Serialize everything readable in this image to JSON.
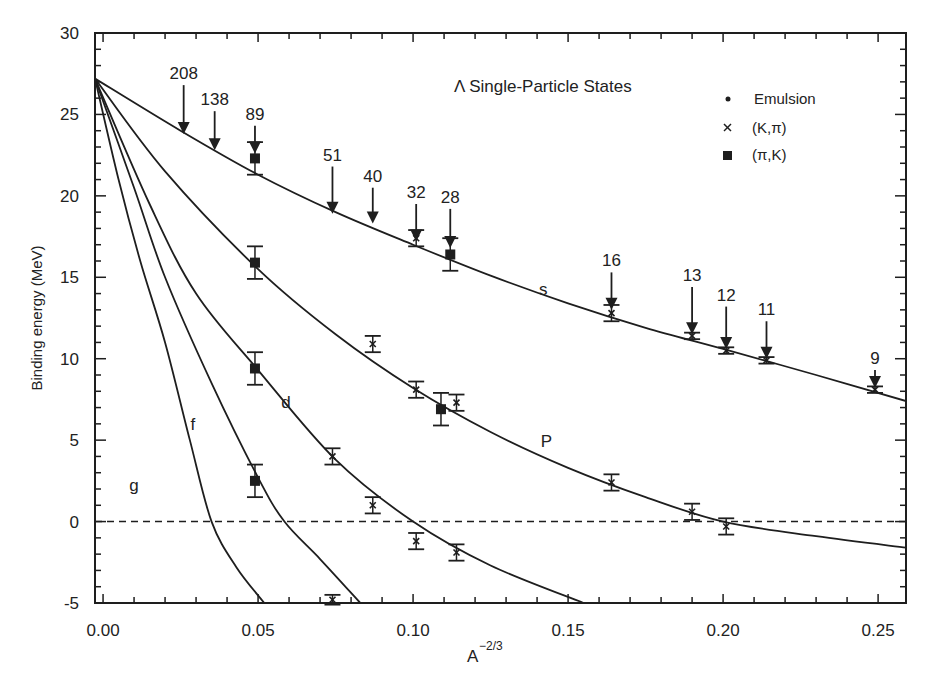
{
  "chart_data": {
    "type": "scatter",
    "title": "",
    "annotation_title": "Λ Single-Particle States",
    "xlabel": "A",
    "xlabel_superscript": "−2/3",
    "ylabel": "Binding energy (MeV)",
    "xlim": [
      -0.0026,
      0.259
    ],
    "ylim": [
      -5,
      30
    ],
    "x_ticks": [
      0.0,
      0.05,
      0.1,
      0.15,
      0.2,
      0.25
    ],
    "x_tick_labels": [
      "0.00",
      "0.05",
      "0.10",
      "0.15",
      "0.20",
      "0.25"
    ],
    "x_minor_step": 0.01,
    "y_ticks": [
      -5,
      0,
      5,
      10,
      15,
      20,
      25,
      30
    ],
    "y_tick_labels": [
      "-5",
      "0",
      "5",
      "10",
      "15",
      "20",
      "25",
      "30"
    ],
    "y_minor_step": 1,
    "grid": false,
    "zero_line": {
      "y": 0,
      "style": "dashed"
    },
    "legend": {
      "position": "upper right",
      "entries": [
        {
          "label": "Emulsion",
          "marker": "dot"
        },
        {
          "label": "(K,π)",
          "marker": "cross"
        },
        {
          "label": "(π,K)",
          "marker": "square"
        }
      ]
    },
    "curves": [
      {
        "name": "s",
        "label_pos": [
          0.142,
          13.9
        ],
        "points": [
          [
            -0.0026,
            27.2
          ],
          [
            0.025,
            24.0
          ],
          [
            0.05,
            21.3
          ],
          [
            0.075,
            19.0
          ],
          [
            0.1,
            17.0
          ],
          [
            0.125,
            15.1
          ],
          [
            0.15,
            13.4
          ],
          [
            0.175,
            11.9
          ],
          [
            0.2,
            10.6
          ],
          [
            0.23,
            9.0
          ],
          [
            0.259,
            7.4
          ]
        ]
      },
      {
        "name": "P",
        "label_pos": [
          0.143,
          4.6
        ],
        "points": [
          [
            -0.0026,
            27.2
          ],
          [
            0.02,
            21.5
          ],
          [
            0.05,
            15.5
          ],
          [
            0.075,
            11.5
          ],
          [
            0.1,
            8.2
          ],
          [
            0.125,
            5.5
          ],
          [
            0.15,
            3.3
          ],
          [
            0.175,
            1.5
          ],
          [
            0.2,
            0.0
          ],
          [
            0.23,
            -0.9
          ],
          [
            0.259,
            -1.6
          ]
        ]
      },
      {
        "name": "d",
        "label_pos": [
          0.059,
          7.0
        ],
        "points": [
          [
            -0.0026,
            27.2
          ],
          [
            0.015,
            19.5
          ],
          [
            0.03,
            14.0
          ],
          [
            0.05,
            9.3
          ],
          [
            0.075,
            3.8
          ],
          [
            0.1,
            0.0
          ],
          [
            0.125,
            -2.7
          ],
          [
            0.155,
            -5.0
          ]
        ]
      },
      {
        "name": "f",
        "label_pos": [
          0.029,
          5.6
        ],
        "points": [
          [
            -0.0026,
            27.2
          ],
          [
            0.01,
            20.5
          ],
          [
            0.02,
            15.0
          ],
          [
            0.035,
            8.5
          ],
          [
            0.05,
            2.7
          ],
          [
            0.0585,
            0.0
          ],
          [
            0.07,
            -2.3
          ],
          [
            0.083,
            -5.0
          ]
        ]
      },
      {
        "name": "g",
        "label_pos": [
          0.01,
          1.9
        ],
        "points": [
          [
            -0.0026,
            27.2
          ],
          [
            0.005,
            21.0
          ],
          [
            0.012,
            16.0
          ],
          [
            0.02,
            11.0
          ],
          [
            0.028,
            5.0
          ],
          [
            0.035,
            0.0
          ],
          [
            0.043,
            -2.8
          ],
          [
            0.052,
            -5.0
          ]
        ]
      }
    ],
    "series": [
      {
        "name": "(π,K)",
        "marker": "square",
        "points": [
          {
            "x": 0.049,
            "y": 22.3,
            "err": 1.0
          },
          {
            "x": 0.112,
            "y": 16.4,
            "err": 1.0
          },
          {
            "x": 0.049,
            "y": 15.9,
            "err": 1.0
          },
          {
            "x": 0.049,
            "y": 9.4,
            "err": 1.0
          },
          {
            "x": 0.109,
            "y": 6.9,
            "err": 1.0
          },
          {
            "x": 0.049,
            "y": 2.5,
            "err": 1.0
          }
        ]
      },
      {
        "name": "(K,π)",
        "marker": "cross",
        "points": [
          {
            "x": 0.101,
            "y": 17.4,
            "err": 0.5
          },
          {
            "x": 0.164,
            "y": 12.8,
            "err": 0.5
          },
          {
            "x": 0.19,
            "y": 11.4,
            "err": 0.2
          },
          {
            "x": 0.201,
            "y": 10.5,
            "err": 0.2
          },
          {
            "x": 0.214,
            "y": 9.9,
            "err": 0.2
          },
          {
            "x": 0.249,
            "y": 8.1,
            "err": 0.2
          },
          {
            "x": 0.087,
            "y": 10.9,
            "err": 0.5
          },
          {
            "x": 0.101,
            "y": 8.1,
            "err": 0.5
          },
          {
            "x": 0.114,
            "y": 7.3,
            "err": 0.5
          },
          {
            "x": 0.164,
            "y": 2.4,
            "err": 0.5
          },
          {
            "x": 0.19,
            "y": 0.6,
            "err": 0.5
          },
          {
            "x": 0.201,
            "y": -0.3,
            "err": 0.5
          },
          {
            "x": 0.074,
            "y": 4.0,
            "err": 0.5
          },
          {
            "x": 0.087,
            "y": 1.0,
            "err": 0.5
          },
          {
            "x": 0.101,
            "y": -1.2,
            "err": 0.5
          },
          {
            "x": 0.114,
            "y": -1.9,
            "err": 0.5
          },
          {
            "x": 0.074,
            "y": -4.8,
            "err": 0.3
          }
        ]
      }
    ],
    "mass_arrows": [
      {
        "label": "208",
        "x": 0.026,
        "y_top": 26.8,
        "y_tip": 23.8
      },
      {
        "label": "138",
        "x": 0.036,
        "y_top": 25.2,
        "y_tip": 22.8
      },
      {
        "label": "89",
        "x": 0.049,
        "y_top": 24.3,
        "y_tip": 22.6
      },
      {
        "label": "51",
        "x": 0.074,
        "y_top": 21.8,
        "y_tip": 18.9
      },
      {
        "label": "40",
        "x": 0.087,
        "y_top": 20.5,
        "y_tip": 18.3
      },
      {
        "label": "32",
        "x": 0.101,
        "y_top": 19.5,
        "y_tip": 17.2
      },
      {
        "label": "28",
        "x": 0.112,
        "y_top": 19.2,
        "y_tip": 16.8
      },
      {
        "label": "16",
        "x": 0.164,
        "y_top": 15.3,
        "y_tip": 13.0
      },
      {
        "label": "13",
        "x": 0.19,
        "y_top": 14.4,
        "y_tip": 11.5
      },
      {
        "label": "12",
        "x": 0.201,
        "y_top": 13.2,
        "y_tip": 10.6
      },
      {
        "label": "11",
        "x": 0.214,
        "y_top": 12.3,
        "y_tip": 10.0
      },
      {
        "label": "9",
        "x": 0.249,
        "y_top": 9.3,
        "y_tip": 8.2
      }
    ]
  },
  "colors": {
    "ink": "#1e1e1e",
    "background": "#ffffff"
  }
}
